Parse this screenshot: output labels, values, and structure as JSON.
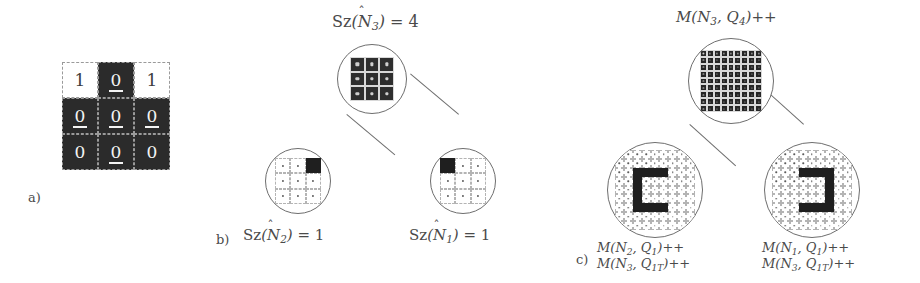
{
  "figure": {
    "background": "#ffffff",
    "ink": "#3a3a3a",
    "dark_cell": "#2b2b2b",
    "light_cell": "#ffffff",
    "lens_stroke": "#6e6e6e"
  },
  "panel_a": {
    "tag": "a)",
    "grid": {
      "rows": 3,
      "cols": 3,
      "cells": [
        {
          "value": "1",
          "fill": "light",
          "underlined": false
        },
        {
          "value": "0",
          "fill": "dark",
          "underlined": true
        },
        {
          "value": "1",
          "fill": "light",
          "underlined": false
        },
        {
          "value": "0",
          "fill": "dark",
          "underlined": true
        },
        {
          "value": "0",
          "fill": "dark",
          "underlined": true
        },
        {
          "value": "0",
          "fill": "dark",
          "underlined": true
        },
        {
          "value": "0",
          "fill": "dark",
          "underlined": false
        },
        {
          "value": "0",
          "fill": "dark",
          "underlined": true
        },
        {
          "value": "0",
          "fill": "dark",
          "underlined": false
        }
      ]
    }
  },
  "panel_b": {
    "tag": "b)",
    "top_label": {
      "fn": "Sz",
      "arg": "N",
      "arg_sub": "3",
      "hat": true,
      "eq": "= 4",
      "text": "Sz(N̂3) = 4"
    },
    "left_label": {
      "fn": "Sz",
      "arg": "N",
      "arg_sub": "2",
      "hat": true,
      "eq": "= 1",
      "text": "Sz(N̂2) = 1"
    },
    "right_label": {
      "fn": "Sz",
      "arg": "N",
      "arg_sub": "1",
      "hat": true,
      "eq": "= 1",
      "text": "Sz(N̂1) = 1"
    },
    "top_lens": {
      "name": "full-occupied-3x3",
      "rows": 3,
      "cols": 3,
      "pattern": [
        "solid",
        "solid",
        "solid",
        "solid",
        "solid",
        "solid",
        "solid",
        "solid",
        "solid"
      ]
    },
    "left_lens": {
      "name": "single-marker-top-right",
      "rows": 3,
      "cols": 3,
      "pattern": [
        "empty",
        "empty",
        "filled",
        "empty",
        "empty",
        "empty",
        "empty",
        "empty",
        "empty"
      ]
    },
    "right_lens": {
      "name": "single-marker-top-left",
      "rows": 3,
      "cols": 3,
      "pattern": [
        "filled",
        "empty",
        "empty",
        "empty",
        "empty",
        "empty",
        "empty",
        "empty",
        "empty"
      ]
    }
  },
  "panel_c": {
    "tag": "c)",
    "top_label": {
      "text": "M(N3, Q4)++",
      "fn": "M",
      "a": "N",
      "a_sub": "3",
      "b": "Q",
      "b_sub": "4",
      "op": "++"
    },
    "left_labels": [
      {
        "text": "M(N2, Q1)++",
        "fn": "M",
        "a": "N",
        "a_sub": "2",
        "b": "Q",
        "b_sub": "1",
        "op": "++"
      },
      {
        "text": "M(N3, Q1T)++",
        "fn": "M",
        "a": "N",
        "a_sub": "3",
        "b": "Q",
        "b_sub": "1T",
        "op": "++"
      }
    ],
    "right_labels": [
      {
        "text": "M(N1, Q1)++",
        "fn": "M",
        "a": "N",
        "a_sub": "1",
        "b": "Q",
        "b_sub": "1",
        "op": "++"
      },
      {
        "text": "M(N3, Q1T)++",
        "fn": "M",
        "a": "N",
        "a_sub": "3",
        "b": "Q",
        "b_sub": "1T",
        "op": "++"
      }
    ],
    "top_lens": {
      "name": "full-occupied-9x9",
      "rows": 9,
      "cols": 9,
      "pattern": [
        "solid",
        "solid",
        "solid",
        "solid",
        "solid",
        "solid",
        "solid",
        "solid",
        "solid",
        "solid",
        "solid",
        "solid",
        "solid",
        "solid",
        "solid",
        "solid",
        "solid",
        "solid",
        "solid",
        "solid",
        "solid",
        "solid",
        "solid",
        "solid",
        "solid",
        "solid",
        "solid",
        "solid",
        "solid",
        "solid",
        "solid",
        "solid",
        "solid",
        "solid",
        "solid",
        "solid",
        "solid",
        "solid",
        "solid",
        "solid",
        "solid",
        "solid",
        "solid",
        "solid",
        "solid",
        "solid",
        "solid",
        "solid",
        "solid",
        "solid",
        "solid",
        "solid",
        "solid",
        "solid",
        "solid",
        "solid",
        "solid",
        "solid",
        "solid",
        "solid",
        "solid",
        "solid",
        "solid",
        "solid",
        "solid",
        "solid",
        "solid",
        "solid",
        "solid",
        "solid",
        "solid",
        "solid",
        "solid",
        "solid",
        "solid",
        "solid",
        "solid",
        "solid",
        "solid",
        "solid",
        "solid"
      ]
    },
    "left_lens": {
      "name": "c-shape-pattern",
      "rows": 9,
      "cols": 9,
      "pattern": [
        "empty",
        "empty",
        "empty",
        "empty",
        "empty",
        "empty",
        "empty",
        "empty",
        "empty",
        "empty",
        "empty",
        "empty",
        "empty",
        "empty",
        "empty",
        "empty",
        "empty",
        "empty",
        "empty",
        "empty",
        "filled",
        "filled",
        "filled",
        "filled",
        "empty",
        "empty",
        "empty",
        "empty",
        "empty",
        "filled",
        "empty",
        "empty",
        "empty",
        "empty",
        "empty",
        "empty",
        "empty",
        "empty",
        "filled",
        "empty",
        "empty",
        "empty",
        "empty",
        "empty",
        "empty",
        "empty",
        "empty",
        "filled",
        "empty",
        "empty",
        "empty",
        "empty",
        "empty",
        "empty",
        "empty",
        "empty",
        "filled",
        "filled",
        "filled",
        "filled",
        "empty",
        "empty",
        "empty",
        "empty",
        "empty",
        "empty",
        "empty",
        "empty",
        "empty",
        "empty",
        "empty",
        "empty",
        "empty",
        "empty",
        "empty",
        "empty",
        "empty",
        "empty",
        "empty",
        "empty",
        "empty"
      ]
    },
    "right_lens": {
      "name": "reversed-c-shape-pattern",
      "rows": 9,
      "cols": 9,
      "pattern": [
        "empty",
        "empty",
        "empty",
        "empty",
        "empty",
        "empty",
        "empty",
        "empty",
        "empty",
        "empty",
        "empty",
        "empty",
        "empty",
        "empty",
        "empty",
        "empty",
        "empty",
        "empty",
        "empty",
        "empty",
        "empty",
        "filled",
        "filled",
        "filled",
        "filled",
        "empty",
        "empty",
        "empty",
        "empty",
        "empty",
        "empty",
        "empty",
        "empty",
        "filled",
        "empty",
        "empty",
        "empty",
        "empty",
        "empty",
        "empty",
        "empty",
        "empty",
        "filled",
        "empty",
        "empty",
        "empty",
        "empty",
        "empty",
        "empty",
        "empty",
        "empty",
        "filled",
        "empty",
        "empty",
        "empty",
        "empty",
        "empty",
        "filled",
        "filled",
        "filled",
        "filled",
        "empty",
        "empty",
        "empty",
        "empty",
        "empty",
        "empty",
        "empty",
        "empty",
        "empty",
        "empty",
        "empty",
        "empty",
        "empty",
        "empty",
        "empty",
        "empty",
        "empty",
        "empty",
        "empty",
        "empty"
      ]
    }
  }
}
